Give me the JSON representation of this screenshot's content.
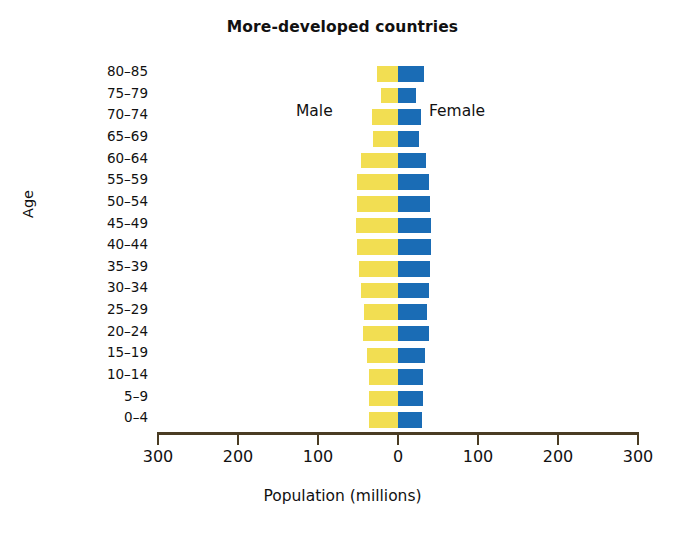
{
  "chart_data": {
    "type": "bar",
    "title": "More-developed countries",
    "xlabel": "Population (millions)",
    "ylabel": "Age",
    "orientation": "horizontal-pyramid",
    "xlim": [
      -300,
      300
    ],
    "xticks": [
      300,
      200,
      100,
      0,
      100,
      200,
      300
    ],
    "grid": false,
    "legend_position": "inside-top",
    "categories": [
      "80–85",
      "75–79",
      "70–74",
      "65–69",
      "60–64",
      "55–59",
      "50–54",
      "45–49",
      "40–44",
      "35–39",
      "30–34",
      "25–29",
      "20–24",
      "15–19",
      "10–14",
      "5–9",
      "0–4"
    ],
    "series": [
      {
        "name": "Male",
        "color": "#f2de52",
        "side": "left",
        "values": [
          28,
          22,
          34,
          32,
          48,
          52,
          52,
          54,
          52,
          50,
          48,
          44,
          45,
          40,
          38,
          38,
          38
        ]
      },
      {
        "name": "Female",
        "color": "#1a6cb5",
        "side": "right",
        "values": [
          34,
          24,
          30,
          28,
          36,
          40,
          41,
          42,
          42,
          41,
          40,
          38,
          40,
          35,
          32,
          32,
          31
        ]
      }
    ],
    "annotations": [
      "Male",
      "Female"
    ]
  },
  "axis": {
    "tick_labels": [
      "300",
      "200",
      "100",
      "0",
      "100",
      "200",
      "300"
    ]
  },
  "legend": {
    "male_label": "Male",
    "female_label": "Female"
  },
  "colors": {
    "male": "#f2de52",
    "female": "#1a6cb5",
    "axis": "#4a3c23",
    "text": "#111111"
  }
}
